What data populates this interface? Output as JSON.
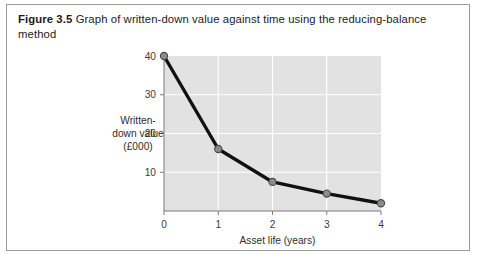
{
  "figure": {
    "number": "Figure 3.5",
    "caption": "Graph of written-down value against time using the reducing-balance method"
  },
  "colors": {
    "plot_background": "#e2e2e2",
    "gridline": "#ffffff",
    "axis": "#7a7a7a",
    "line": "#111111",
    "marker_fill": "#8c8c8c",
    "marker_stroke": "#4a4a4a",
    "frame_border": "#9a9a9a",
    "text": "#1b1b1b"
  },
  "chart_data": {
    "type": "line",
    "title": "",
    "xlabel": "Asset life (years)",
    "ylabel": "Written-down value (£000)",
    "ylabel_lines": [
      "Written-",
      "down value",
      "(£000)"
    ],
    "x": [
      0,
      1,
      2,
      3,
      4
    ],
    "values": [
      40,
      16,
      7.5,
      4.5,
      2
    ],
    "xtick_labels": [
      "0",
      "1",
      "2",
      "3",
      "4"
    ],
    "ytick_labels": [
      "40",
      "30",
      "20",
      "10"
    ],
    "yticks": [
      40,
      30,
      20,
      10
    ],
    "xlim": [
      0,
      4
    ],
    "ylim": [
      0,
      40
    ],
    "grid": true,
    "legend": "none",
    "series": [
      {
        "name": "Written-down value",
        "values": [
          40,
          16,
          7.5,
          4.5,
          2
        ]
      }
    ]
  }
}
